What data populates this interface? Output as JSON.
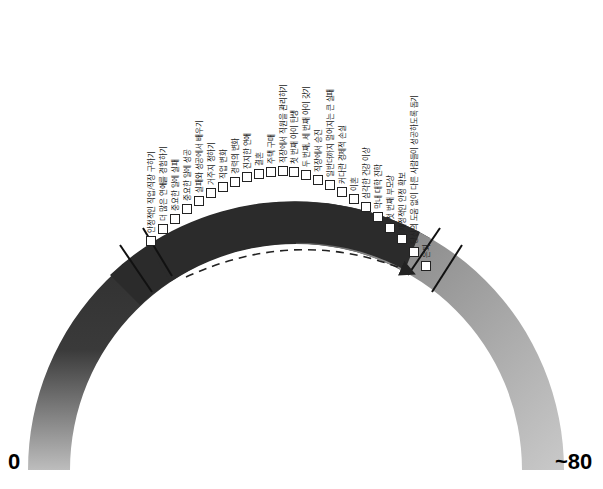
{
  "diagram": {
    "axis": {
      "start_label": "0",
      "end_label": "~80"
    },
    "colors": {
      "arc_dark": "#2b2b2b",
      "arc_light": "#c8c8c8",
      "tick": "#111111",
      "arrow": "#222222"
    },
    "events": [
      "안정적인 직업/직장 구하기",
      "더 많은 연애를 경험하기",
      "중요한 일에 실패",
      "중요한 일에 성공",
      "실패와 성공에서 배우기",
      "거주지 정하기",
      "직업 변화",
      "경력의 변화",
      "진지한 연애",
      "결혼",
      "주택 구매",
      "직장에서 직원을 관리하기",
      "첫 번째 아이 탄생",
      "두 번째, 세 번째 아이 갖기",
      "직장에서 승진",
      "일반더까지 멀어지는 큰 실패",
      "커다란 경제적 손실",
      "이혼",
      "심각한 건강 이상",
      "막내 대학 진학",
      "첫 번째 부모상",
      "재정적인 안정 확보",
      "당신의 도움 없이 다른 사람들이 성공하도록 돕기",
      "은퇴"
    ]
  }
}
